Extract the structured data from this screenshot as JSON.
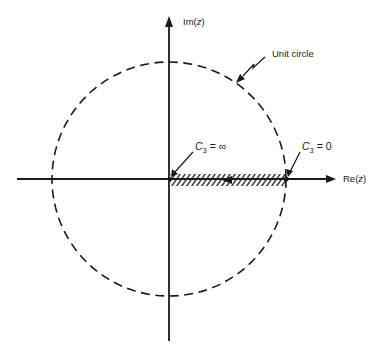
{
  "figure": {
    "type": "complex-plane diagram",
    "axes": {
      "imaginary_label_prefix": "Im(",
      "imaginary_label_var": "z",
      "imaginary_label_suffix": ")",
      "real_label_prefix": "Re(",
      "real_label_var": "z",
      "real_label_suffix": ")"
    },
    "unit_circle": {
      "label": "Unit circle",
      "style": "dashed"
    },
    "locus": {
      "description": "hatched segment on positive real axis from origin to z = 1, arrow pointing toward origin",
      "start_label": {
        "symbol": "C",
        "subscript": "3",
        "equals": " = ",
        "value": "∞"
      },
      "end_label": {
        "symbol": "C",
        "subscript": "3",
        "equals": " = ",
        "value": "0"
      }
    },
    "colors": {
      "ink": "#1a1a1a",
      "background": "#ffffff"
    }
  }
}
